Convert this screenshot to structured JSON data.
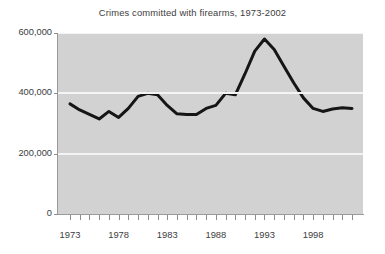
{
  "chart_data": {
    "type": "line",
    "title": "Crimes committed with firearms, 1973-2002",
    "xlabel": "",
    "ylabel": "",
    "xlim": [
      1973,
      2002
    ],
    "ylim": [
      0,
      600000
    ],
    "grid": true,
    "grid_axis": "y",
    "legend": false,
    "legend_position": "none",
    "y_ticks": [
      0,
      200000,
      400000,
      600000
    ],
    "y_tick_labels": [
      "0",
      "200,000",
      "400,000",
      "600,000"
    ],
    "x_ticks": [
      1973,
      1978,
      1983,
      1988,
      1993,
      1998
    ],
    "x_tick_labels": [
      "1973",
      "1978",
      "1983",
      "1988",
      "1993",
      "1998"
    ],
    "x_minor_tick_interval": 1,
    "series": [
      {
        "name": "Crimes committed with firearms",
        "color": "#151515",
        "line_width": 3,
        "x": [
          1973,
          1974,
          1975,
          1976,
          1977,
          1978,
          1979,
          1980,
          1981,
          1982,
          1983,
          1984,
          1985,
          1986,
          1987,
          1988,
          1989,
          1990,
          1991,
          1992,
          1993,
          1994,
          1995,
          1996,
          1997,
          1998,
          1999,
          2000,
          2001,
          2002
        ],
        "values": [
          365000,
          345000,
          330000,
          315000,
          340000,
          320000,
          350000,
          390000,
          400000,
          395000,
          360000,
          332000,
          330000,
          330000,
          350000,
          360000,
          400000,
          395000,
          465000,
          540000,
          580000,
          545000,
          490000,
          435000,
          385000,
          350000,
          340000,
          348000,
          352000,
          350000
        ]
      }
    ],
    "colors": {
      "plot_background": "#d2d2d2",
      "gridline": "#f4f4f4",
      "line": "#151515",
      "axis": "#9a9a9a",
      "text": "#3d3d3d",
      "figure_background": "#ffffff"
    }
  }
}
